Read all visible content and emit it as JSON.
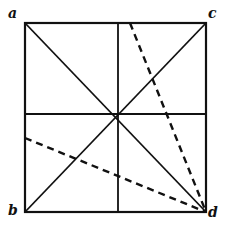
{
  "diagram": {
    "type": "geometric-folding-square",
    "stroke_color": "#111111",
    "background": "#ffffff",
    "square": {
      "x1": 25,
      "y1": 23,
      "x2": 206,
      "y2": 212
    },
    "labels": [
      {
        "id": "a",
        "text": "a",
        "x": 8,
        "y": 6
      },
      {
        "id": "c",
        "text": "c",
        "x": 208,
        "y": 6
      },
      {
        "id": "b",
        "text": "b",
        "x": 8,
        "y": 203
      },
      {
        "id": "d",
        "text": "d",
        "x": 208,
        "y": 205
      }
    ],
    "solid_lines": [
      {
        "name": "diagonal-a-d",
        "x1": 25,
        "y1": 23,
        "x2": 206,
        "y2": 212
      },
      {
        "name": "diagonal-b-c",
        "x1": 25,
        "y1": 212,
        "x2": 206,
        "y2": 23
      },
      {
        "name": "vertical-midline",
        "x1": 118,
        "y1": 23,
        "x2": 118,
        "y2": 212
      },
      {
        "name": "horizontal-midline",
        "x1": 25,
        "y1": 114,
        "x2": 206,
        "y2": 114
      }
    ],
    "dashed_lines": [
      {
        "name": "dashed-top-to-d",
        "x1": 130,
        "y1": 23,
        "x2": 206,
        "y2": 212
      },
      {
        "name": "dashed-left-to-d",
        "x1": 25,
        "y1": 138,
        "x2": 206,
        "y2": 212
      }
    ]
  }
}
